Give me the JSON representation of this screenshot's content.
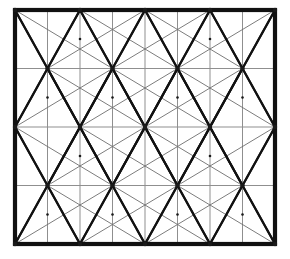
{
  "figure": {
    "type": "geometric-diagram",
    "canvas": {
      "width": 290,
      "height": 259,
      "background": "#ffffff"
    },
    "frame": {
      "name": "outer-border-rectangle",
      "x0": 15,
      "y0": 10,
      "x1": 275,
      "y1": 244,
      "stroke": "#111111",
      "stroke_width": 4.2
    },
    "grid": {
      "columns": 8,
      "rows": 4,
      "vertical_line_x": [
        47.5,
        80.0,
        112.5,
        145.0,
        177.5,
        210.0,
        242.5
      ],
      "horizontal_line_y": [
        68.5,
        127.0,
        185.5
      ],
      "stroke": "#8a8a8a",
      "stroke_width": 1.0
    },
    "hub_vertices": {
      "description": "Star-like vertices where many diagonals converge; positions alternate between staggered rows",
      "stroke": "#1a1a1a",
      "dot_radius": 2.2,
      "rows": [
        {
          "y": 10.0,
          "x": [
            15.0,
            80.0,
            145.0,
            210.0,
            275.0
          ]
        },
        {
          "y": 68.5,
          "x": [
            47.5,
            112.5,
            177.5,
            242.5
          ]
        },
        {
          "y": 127.0,
          "x": [
            15.0,
            80.0,
            145.0,
            210.0,
            275.0
          ]
        },
        {
          "y": 185.5,
          "x": [
            47.5,
            112.5,
            177.5,
            242.5
          ]
        },
        {
          "y": 244.0,
          "x": [
            15.0,
            80.0,
            145.0,
            210.0,
            275.0
          ]
        }
      ]
    },
    "minor_vertices": {
      "description": "Small dots at cell-midpoint crossings of the faint long diagonals",
      "radius": 1.3,
      "points": [
        [
          80.0,
          39.0
        ],
        [
          210.0,
          39.0
        ],
        [
          47.5,
          97.5
        ],
        [
          177.5,
          97.5
        ],
        [
          112.5,
          97.5
        ],
        [
          242.5,
          97.5
        ],
        [
          80.0,
          156.0
        ],
        [
          210.0,
          156.0
        ],
        [
          47.5,
          214.5
        ],
        [
          177.5,
          214.5
        ],
        [
          112.5,
          214.5
        ],
        [
          242.5,
          214.5
        ]
      ]
    },
    "edge_styles": {
      "heavy_diagonal": {
        "stroke": "#111111",
        "stroke_width": 2.1,
        "label": "primary triangulation edge"
      },
      "light_diagonal": {
        "stroke": "#6e6e6e",
        "stroke_width": 0.9,
        "label": "secondary long diagonal"
      },
      "grid_line": {
        "stroke": "#8f8f8f",
        "stroke_width": 1.0,
        "label": "background grid line"
      },
      "border": {
        "stroke": "#111111",
        "stroke_width": 4.2,
        "label": "outer frame"
      }
    },
    "counts": {
      "hub_vertices": 22,
      "grid_cells": 32,
      "vertical_grid_lines": 7,
      "horizontal_grid_lines": 3
    }
  }
}
